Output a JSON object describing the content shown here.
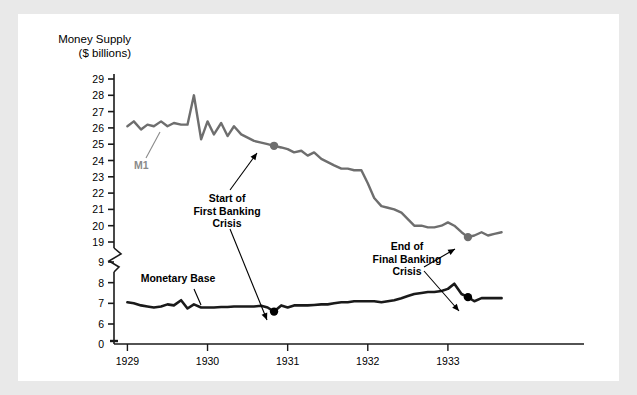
{
  "figure": {
    "background": "#ffffff",
    "page_background": "#e9e9e9"
  },
  "axis_title": "Money Supply\n($ billions)",
  "annotations": {
    "m1_label": "M1",
    "monetary_base_label": "Monetary Base",
    "first_crisis": "Start of\nFirst Banking\nCrisis",
    "final_crisis": "End of\nFinal Banking\nCrisis"
  },
  "colors": {
    "m1_line": "#6e6e6e",
    "base_line": "#1a1a1a",
    "axis": "#1a1a1a",
    "m1_marker": "#6e6e6e",
    "base_marker": "#000000",
    "text": "#000000"
  },
  "chart_data": {
    "type": "line",
    "title": "",
    "subtitle": "",
    "xlabel": "",
    "ylabel": "Money Supply ($ billions)",
    "grid": false,
    "legend": "inline-labels",
    "xlim": [
      1928.92,
      1933.75
    ],
    "x_ticks": [
      1929,
      1930,
      1931,
      1932,
      1933
    ],
    "x_tick_labels": [
      "1929",
      "1930",
      "1931",
      "1932",
      "1933"
    ],
    "y_axis_break": true,
    "y_break_between": [
      9,
      19
    ],
    "y_ticks_upper": [
      19,
      20,
      21,
      22,
      23,
      24,
      25,
      26,
      27,
      28,
      29
    ],
    "y_ticks_lower": [
      0,
      6,
      7,
      8,
      9
    ],
    "y_tick_labels": [
      "0",
      "6",
      "7",
      "8",
      "9",
      "19",
      "20",
      "21",
      "22",
      "23",
      "24",
      "25",
      "26",
      "27",
      "28",
      "29"
    ],
    "series": [
      {
        "name": "M1",
        "color": "#6e6e6e",
        "x": [
          1929.0,
          1929.08,
          1929.17,
          1929.25,
          1929.33,
          1929.42,
          1929.5,
          1929.58,
          1929.67,
          1929.75,
          1929.83,
          1929.92,
          1930.0,
          1930.08,
          1930.17,
          1930.25,
          1930.33,
          1930.42,
          1930.5,
          1930.58,
          1930.67,
          1930.75,
          1930.83,
          1930.92,
          1931.0,
          1931.08,
          1931.17,
          1931.25,
          1931.33,
          1931.42,
          1931.5,
          1931.58,
          1931.67,
          1931.75,
          1931.83,
          1931.92,
          1932.0,
          1932.08,
          1932.17,
          1932.25,
          1932.33,
          1932.42,
          1932.5,
          1932.58,
          1932.67,
          1932.75,
          1932.83,
          1932.92,
          1933.0,
          1933.08,
          1933.17,
          1933.25,
          1933.33,
          1933.42,
          1933.5,
          1933.58,
          1933.67
        ],
        "y": [
          26.1,
          26.4,
          25.9,
          26.2,
          26.1,
          26.4,
          26.1,
          26.3,
          26.2,
          26.2,
          28.0,
          25.3,
          26.4,
          25.6,
          26.3,
          25.5,
          26.1,
          25.6,
          25.4,
          25.2,
          25.1,
          25.0,
          24.9,
          24.8,
          24.7,
          24.5,
          24.6,
          24.3,
          24.5,
          24.1,
          23.9,
          23.7,
          23.5,
          23.5,
          23.4,
          23.4,
          22.6,
          21.7,
          21.2,
          21.1,
          21.0,
          20.8,
          20.4,
          20.0,
          20.0,
          19.9,
          19.9,
          20.0,
          20.2,
          20.0,
          19.6,
          19.3,
          19.4,
          19.6,
          19.4,
          19.5,
          19.6
        ]
      },
      {
        "name": "Monetary Base",
        "color": "#1a1a1a",
        "x": [
          1929.0,
          1929.08,
          1929.17,
          1929.25,
          1929.33,
          1929.42,
          1929.5,
          1929.58,
          1929.67,
          1929.75,
          1929.83,
          1929.92,
          1930.0,
          1930.08,
          1930.17,
          1930.25,
          1930.33,
          1930.42,
          1930.5,
          1930.58,
          1930.67,
          1930.75,
          1930.83,
          1930.92,
          1931.0,
          1931.08,
          1931.17,
          1931.25,
          1931.33,
          1931.42,
          1931.5,
          1931.58,
          1931.67,
          1931.75,
          1931.83,
          1931.92,
          1932.0,
          1932.08,
          1932.17,
          1932.25,
          1932.33,
          1932.42,
          1932.5,
          1932.58,
          1932.67,
          1932.75,
          1932.83,
          1932.92,
          1933.0,
          1933.08,
          1933.17,
          1933.25,
          1933.33,
          1933.42,
          1933.5,
          1933.58,
          1933.67
        ],
        "y": [
          7.05,
          7.0,
          6.9,
          6.85,
          6.8,
          6.85,
          6.95,
          6.9,
          7.15,
          6.75,
          6.95,
          6.8,
          6.8,
          6.8,
          6.82,
          6.82,
          6.85,
          6.85,
          6.85,
          6.85,
          6.88,
          6.8,
          6.6,
          6.9,
          6.8,
          6.9,
          6.9,
          6.9,
          6.92,
          6.95,
          6.95,
          7.0,
          7.05,
          7.05,
          7.1,
          7.1,
          7.1,
          7.1,
          7.05,
          7.1,
          7.15,
          7.25,
          7.35,
          7.45,
          7.5,
          7.55,
          7.55,
          7.6,
          7.7,
          7.95,
          7.45,
          7.3,
          7.1,
          7.25,
          7.25,
          7.25,
          7.25
        ]
      }
    ],
    "markers": [
      {
        "series": "M1",
        "x": 1930.83,
        "y": 24.9,
        "label": "Start of First Banking Crisis",
        "color": "#6e6e6e"
      },
      {
        "series": "Monetary Base",
        "x": 1930.83,
        "y": 6.6,
        "label": "Start of First Banking Crisis",
        "color": "#000000"
      },
      {
        "series": "M1",
        "x": 1933.25,
        "y": 19.3,
        "label": "End of Final Banking Crisis",
        "color": "#6e6e6e"
      },
      {
        "series": "Monetary Base",
        "x": 1933.25,
        "y": 7.3,
        "label": "End of Final Banking Crisis",
        "color": "#000000"
      }
    ]
  }
}
